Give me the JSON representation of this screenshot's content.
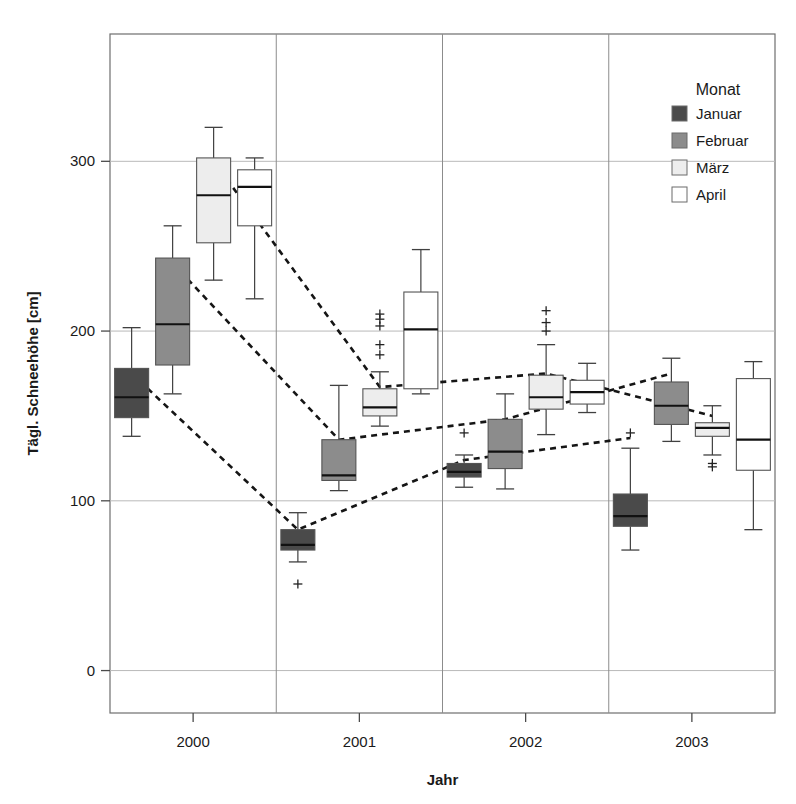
{
  "chart_data": {
    "type": "box",
    "title": "",
    "xlabel": "Jahr",
    "ylabel": "Tägl. Schneehöhe [cm]",
    "ylim": [
      -25,
      375
    ],
    "yticks": [
      0,
      100,
      200,
      300
    ],
    "ytick_labels": [
      "0",
      "100",
      "200",
      "300"
    ],
    "categories": [
      "2000",
      "2001",
      "2002",
      "2003"
    ],
    "grid": "horizontal-major",
    "legend": {
      "title": "Monat",
      "position": "top-right",
      "entries": [
        {
          "label": "Januar",
          "color": "#4a4a4a"
        },
        {
          "label": "Februar",
          "color": "#8c8c8c"
        },
        {
          "label": "März",
          "color": "#ededed"
        },
        {
          "label": "April",
          "color": "#ffffff"
        }
      ]
    },
    "series": [
      {
        "name": "Januar",
        "color": "#4a4a4a",
        "boxes": [
          {
            "year": "2000",
            "whisker_low": 138,
            "q1": 149,
            "median": 161,
            "q3": 178,
            "whisker_high": 202,
            "outliers": []
          },
          {
            "year": "2001",
            "whisker_low": 64,
            "q1": 71,
            "median": 74,
            "q3": 83,
            "whisker_high": 93,
            "outliers": [
              51
            ]
          },
          {
            "year": "2002",
            "whisker_low": 108,
            "q1": 114,
            "median": 117,
            "q3": 122,
            "whisker_high": 127,
            "outliers": [
              140
            ]
          },
          {
            "year": "2003",
            "whisker_low": 71,
            "q1": 85,
            "median": 91,
            "q3": 104,
            "whisker_high": 131,
            "outliers": [
              140
            ]
          }
        ]
      },
      {
        "name": "Februar",
        "color": "#8c8c8c",
        "boxes": [
          {
            "year": "2000",
            "whisker_low": 163,
            "q1": 180,
            "median": 204,
            "q3": 243,
            "whisker_high": 262,
            "outliers": []
          },
          {
            "year": "2001",
            "whisker_low": 106,
            "q1": 112,
            "median": 115,
            "q3": 136,
            "whisker_high": 168,
            "outliers": []
          },
          {
            "year": "2002",
            "whisker_low": 107,
            "q1": 119,
            "median": 129,
            "q3": 148,
            "whisker_high": 163,
            "outliers": []
          },
          {
            "year": "2003",
            "whisker_low": 135,
            "q1": 145,
            "median": 156,
            "q3": 170,
            "whisker_high": 184,
            "outliers": []
          }
        ]
      },
      {
        "name": "März",
        "color": "#ededed",
        "boxes": [
          {
            "year": "2000",
            "whisker_low": 230,
            "q1": 252,
            "median": 280,
            "q3": 302,
            "whisker_high": 320,
            "outliers": []
          },
          {
            "year": "2001",
            "whisker_low": 144,
            "q1": 150,
            "median": 155,
            "q3": 166,
            "whisker_high": 176,
            "outliers": [
              186,
              192,
              203,
              207,
              210
            ]
          },
          {
            "year": "2002",
            "whisker_low": 139,
            "q1": 154,
            "median": 161,
            "q3": 174,
            "whisker_high": 192,
            "outliers": [
              200,
              205,
              212
            ]
          },
          {
            "year": "2003",
            "whisker_low": 127,
            "q1": 138,
            "median": 143,
            "q3": 146,
            "whisker_high": 156,
            "outliers": [
              120,
              122
            ]
          }
        ]
      },
      {
        "name": "April",
        "color": "#ffffff",
        "boxes": [
          {
            "year": "2000",
            "whisker_low": 219,
            "q1": 262,
            "median": 285,
            "q3": 295,
            "whisker_high": 302,
            "outliers": []
          },
          {
            "year": "2001",
            "whisker_low": 163,
            "q1": 166,
            "median": 201,
            "q3": 223,
            "whisker_high": 248,
            "outliers": []
          },
          {
            "year": "2002",
            "whisker_low": 152,
            "q1": 157,
            "median": 164,
            "q3": 171,
            "whisker_high": 181,
            "outliers": []
          },
          {
            "year": "2003",
            "whisker_low": 83,
            "q1": 118,
            "median": 136,
            "q3": 172,
            "whisker_high": 182,
            "outliers": []
          }
        ]
      }
    ],
    "trend_lines": [
      {
        "name": "Januar-trend",
        "points": [
          [
            0,
            175
          ],
          [
            1,
            83
          ],
          [
            2,
            124
          ],
          [
            3,
            137
          ]
        ]
      },
      {
        "name": "Februar-trend",
        "points": [
          [
            0,
            240
          ],
          [
            1,
            136
          ],
          [
            2,
            148
          ],
          [
            3,
            175
          ]
        ]
      },
      {
        "name": "Maerz-trend",
        "points": [
          [
            0,
            300
          ],
          [
            1,
            167
          ],
          [
            2,
            175
          ],
          [
            3,
            150
          ]
        ]
      }
    ]
  }
}
